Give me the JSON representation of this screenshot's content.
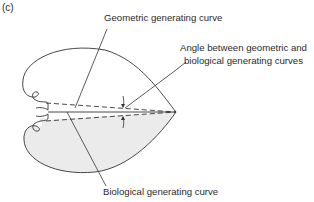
{
  "figure": {
    "panel_label": "(c)",
    "labels": {
      "geometric": "Geometric generating curve",
      "angle_line1": "Angle between geometric and",
      "angle_line2": "biological generating curves",
      "biological": "Biological generating curve"
    },
    "colors": {
      "stroke": "#333333",
      "shaded_valve": "#ebebeb",
      "background": "#ffffff"
    }
  }
}
